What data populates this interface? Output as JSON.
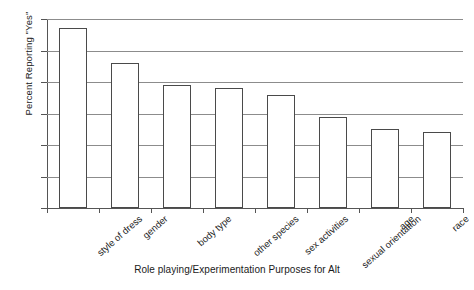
{
  "chart_data": {
    "type": "bar",
    "title": "",
    "xlabel": "Role playing/Experimentation Purposes for Alt",
    "ylabel": "Percent Reporting \"Yes\"",
    "categories": [
      "style of dress",
      "gender",
      "body type",
      "other species",
      "sex activities",
      "sexual orientation",
      "age",
      "race"
    ],
    "values": [
      57,
      46,
      39,
      38,
      36,
      29,
      25,
      24
    ],
    "ylim": [
      0,
      60
    ],
    "yticks": [
      0,
      10,
      20,
      30,
      40,
      50,
      60
    ],
    "ytick_labels": [
      "0",
      "10",
      "20",
      "30",
      "40",
      "50",
      "60"
    ],
    "grid": "horizontal",
    "legend": "none",
    "bar_fill_color": "#ffffff",
    "bar_border_color": "#4a4a4a",
    "gridline_color": "#8c8c8c",
    "axis_color": "#555555"
  }
}
